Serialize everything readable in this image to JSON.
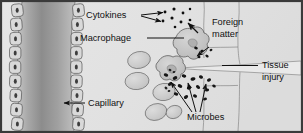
{
  "figure": {
    "width": 303,
    "height": 133,
    "style": "grayscale biology textbook illustration"
  },
  "colors": {
    "frame_border": "#3a3a3a",
    "background_tissue": "#e3e3e3",
    "background_tissue_right": "#dedede",
    "capillary_lumen_light": "#c9c9c9",
    "capillary_lumen_dark": "#8e8e8e",
    "endothelial_cell_fill": "#d8d8d8",
    "endothelial_cell_stroke": "#4a4a4a",
    "cell_fill": "#cfcfcf",
    "cell_stroke": "#5a5a5a",
    "macrophage_fill": "#c6c6c6",
    "macrophage_stroke": "#4f4f4f",
    "microbe_fill": "#1c1c1c",
    "cytokine_fill": "#101010",
    "leader_line": "#111111",
    "text": "#111111",
    "tissue_outline": "#6f6f6f"
  },
  "labels": {
    "cytokines": {
      "text": "Cytokines",
      "x": 86,
      "y": 18,
      "anchor": "start",
      "leader": "forked-double-arrow"
    },
    "macrophage": {
      "text": "Macrophage",
      "x": 80,
      "y": 41,
      "anchor": "start",
      "leader": "straight-line"
    },
    "foreign_matter": {
      "line1": "Foreign",
      "line2": "matter",
      "x": 212,
      "y1": 25,
      "y2": 37,
      "anchor": "start",
      "leader": "arrow-down-left"
    },
    "tissue_injury": {
      "line1": "Tissue",
      "line2": "injury",
      "x": 262,
      "y1": 68,
      "y2": 80,
      "anchor": "start",
      "leader": "horizontal-line-left"
    },
    "capillary": {
      "text": "Capillary",
      "x": 88,
      "y": 106,
      "anchor": "start",
      "leader": "arrow-left"
    },
    "microbes": {
      "text": "Microbes",
      "x": 187,
      "y": 120,
      "anchor": "start",
      "leader": "three-pronged-fan"
    }
  },
  "structures": {
    "capillary": {
      "name": "capillary",
      "description": "vertical blood vessel at left with endothelial cell lining on both walls",
      "endothelial_cells_left": 9,
      "endothelial_cells_right": 9
    },
    "macrophages": {
      "name": "macrophage",
      "count": 2,
      "description": "amoeboid lobed phagocytic cells engulfing debris"
    },
    "tissue_cells": {
      "name": "tissue-cell",
      "count": 5,
      "description": "oval light gray cells in tissue space"
    },
    "cytokines": {
      "name": "cytokine",
      "count": 9,
      "description": "small black dots released by macrophage"
    },
    "microbes": {
      "name": "microbe",
      "count": 16,
      "description": "dark rod shaped bacteria near wound"
    },
    "foreign_matter": {
      "name": "foreign-matter",
      "count": 5,
      "description": "small dark debris particles at wound edge"
    },
    "tissue_injury": {
      "name": "tissue-injury",
      "description": "wedge shaped wound gap opening from the right edge"
    }
  }
}
